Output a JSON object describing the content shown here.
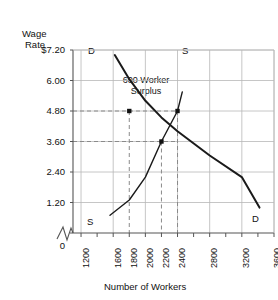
{
  "chart_data": {
    "type": "line",
    "title": "",
    "ylabel": "Wage Rate",
    "xlabel": "Number of Workers",
    "ylim": [
      0,
      7.2
    ],
    "xlim": [
      1100,
      3600
    ],
    "grid": true,
    "legend": "inline-curve-labels",
    "ytick_labels": [
      "$7.20",
      "6.00",
      "4.80",
      "3.60",
      "2.40",
      "1.20",
      "0"
    ],
    "ytick_values": [
      7.2,
      6.0,
      4.8,
      3.6,
      2.4,
      1.2,
      0
    ],
    "xtick_labels": [
      "1200",
      "1600",
      "1800",
      "2000",
      "2200",
      "2400",
      "2800",
      "3200",
      "3600"
    ],
    "xtick_values": [
      1200,
      1600,
      1800,
      2000,
      2200,
      2400,
      2800,
      3200,
      3600
    ],
    "axis_break": true,
    "series": [
      {
        "name": "Demand",
        "label": "D",
        "label_start": "D",
        "label_end": "D",
        "points": [
          {
            "x": 1620,
            "y": 7.0
          },
          {
            "x": 1800,
            "y": 6.05
          },
          {
            "x": 2000,
            "y": 5.2
          },
          {
            "x": 2200,
            "y": 4.55
          },
          {
            "x": 2400,
            "y": 4.0
          },
          {
            "x": 2800,
            "y": 3.05
          },
          {
            "x": 3200,
            "y": 2.2
          },
          {
            "x": 3420,
            "y": 1.0
          }
        ]
      },
      {
        "name": "Supply",
        "label": "S",
        "label_start": "S",
        "label_end": "S",
        "points": [
          {
            "x": 1560,
            "y": 0.7
          },
          {
            "x": 1800,
            "y": 1.3
          },
          {
            "x": 2000,
            "y": 2.2
          },
          {
            "x": 2200,
            "y": 3.6
          },
          {
            "x": 2400,
            "y": 4.8
          },
          {
            "x": 2460,
            "y": 5.55
          }
        ]
      }
    ],
    "markers": [
      {
        "x": 1800,
        "y": 4.8,
        "name": "demand-at-480"
      },
      {
        "x": 2200,
        "y": 3.6,
        "name": "equilibrium"
      },
      {
        "x": 2400,
        "y": 4.8,
        "name": "supply-at-480"
      }
    ],
    "guide_lines": {
      "horizontal": [
        4.8,
        3.6
      ],
      "vertical": [
        1800,
        2200,
        2400
      ]
    },
    "annotations": [
      {
        "text_line1": "600 Worker",
        "text_line2": "Surplus",
        "x": 2100,
        "y": 5.45
      }
    ]
  },
  "labels": {
    "y_axis_title_line1": "Wage",
    "y_axis_title_line2": "Rate",
    "x_axis_title": "Number of Workers",
    "demand_top": "D",
    "demand_bottom": "D",
    "supply_top": "S",
    "supply_bottom": "S",
    "annotation_line1": "600 Worker",
    "annotation_line2": "Surplus"
  },
  "colors": {
    "curve": "#1a1a1a",
    "grid": "#b8b8b8",
    "dashed": "#8a8a8a",
    "axis": "#555555",
    "background": "#ffffff"
  }
}
